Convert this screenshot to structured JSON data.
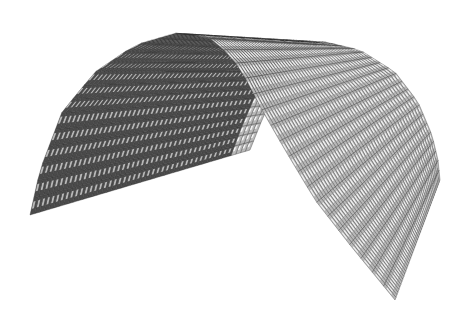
{
  "image": {
    "description": "3D render of an arched (barrel vault) surface tessellated with small faceted block tiles",
    "background": "#ffffff",
    "width": 467,
    "height": 316
  },
  "surface": {
    "front_arch": [
      [
        30,
        215
      ],
      [
        40,
        170
      ],
      [
        62,
        112
      ],
      [
        95,
        72
      ],
      [
        135,
        45
      ],
      [
        180,
        32
      ],
      [
        215,
        40
      ],
      [
        240,
        68
      ],
      [
        262,
        110
      ],
      [
        285,
        150
      ],
      [
        315,
        200
      ],
      [
        350,
        245
      ],
      [
        395,
        300
      ]
    ],
    "back_arch": [
      [
        250,
        150
      ],
      [
        262,
        120
      ],
      [
        280,
        80
      ],
      [
        300,
        55
      ],
      [
        325,
        42
      ],
      [
        360,
        50
      ],
      [
        395,
        72
      ],
      [
        418,
        102
      ],
      [
        432,
        135
      ],
      [
        438,
        160
      ],
      [
        440,
        180
      ]
    ],
    "rows_u": 34,
    "cols_v": 46,
    "colors": {
      "tile_light": "#f2f2f2",
      "tile_mid": "#b8b8b8",
      "tile_dark": "#5a5a5a",
      "tile_shadow": "#2e2e2e",
      "interior": "#4a4a4a"
    }
  }
}
